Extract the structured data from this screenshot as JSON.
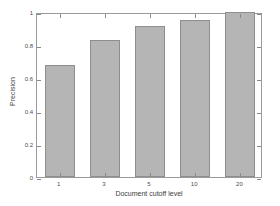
{
  "chart_data": {
    "type": "bar",
    "title": "",
    "subtitle": "",
    "xlabel": "Document cutoff level",
    "ylabel": "Precision",
    "categories": [
      "1",
      "3",
      "5",
      "10",
      "20"
    ],
    "values": [
      0.68,
      0.83,
      0.915,
      0.95,
      1.0
    ],
    "series": [
      {
        "name": "Precision",
        "values": [
          0.68,
          0.83,
          0.915,
          0.95,
          1.0
        ]
      }
    ],
    "ylim": [
      0,
      1
    ],
    "yticks": [
      0,
      0.2,
      0.4,
      0.6,
      0.8,
      1
    ],
    "ytick_labels": [
      "0",
      "0.2",
      "0.4",
      "0.6",
      "0.8",
      "1"
    ],
    "xtick_labels": [
      "1",
      "3",
      "5",
      "10",
      "20"
    ],
    "grid": false,
    "legend": false,
    "legend_position": "none",
    "annotations": [],
    "colors": {
      "bar_fill": "#b5b5b5",
      "bar_edge": "#8e8e8e",
      "axis": "#9a9a9a",
      "text": "#3d3d3d",
      "background": "#ffffff"
    }
  }
}
